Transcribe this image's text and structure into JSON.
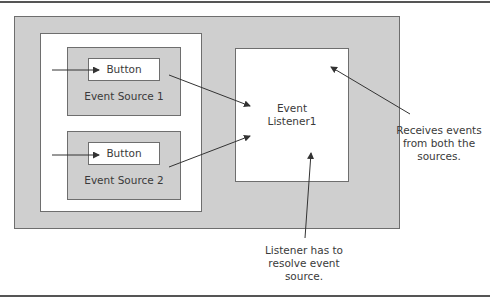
{
  "diagram": {
    "event_sources": [
      {
        "name": "Event Source 1",
        "button_label": "Button"
      },
      {
        "name": "Event Source 2",
        "button_label": "Button"
      }
    ],
    "listener": {
      "line1": "Event",
      "line2": "Listener1"
    },
    "annotations": {
      "receives": {
        "line1": "Receives events",
        "line2": "from both the",
        "line3": "sources."
      },
      "resolve": {
        "line1": "Listener has to",
        "line2": "resolve event",
        "line3": "source."
      }
    },
    "colors": {
      "panel_gray": "#cfcfcf",
      "border": "#6e6e6e",
      "arrow": "#333333"
    }
  }
}
